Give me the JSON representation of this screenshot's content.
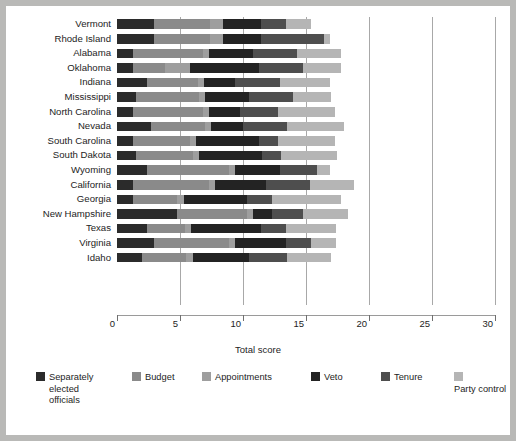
{
  "chart_data": {
    "type": "bar",
    "orientation": "horizontal",
    "stacked": true,
    "title": "",
    "xlabel": "Total score",
    "ylabel": "",
    "xlim": [
      0,
      30
    ],
    "xticks": [
      0,
      5,
      10,
      15,
      20,
      25,
      30
    ],
    "grid": true,
    "legend_position": "bottom",
    "categories": [
      "Vermont",
      "Rhode Island",
      "Alabama",
      "Oklahoma",
      "Indiana",
      "Mississippi",
      "North Carolina",
      "Nevada",
      "South Carolina",
      "South Dakota",
      "Wyoming",
      "California",
      "Georgia",
      "New Hampshire",
      "Texas",
      "Virginia",
      "Idaho"
    ],
    "series": [
      {
        "name": "Separately elected officials",
        "color": "#2b2b2b",
        "values": [
          2.9,
          2.9,
          1.3,
          1.3,
          2.4,
          1.5,
          1.3,
          2.7,
          1.3,
          1.5,
          2.4,
          1.3,
          1.3,
          4.8,
          2.4,
          2.9,
          2.0
        ]
      },
      {
        "name": "Budget",
        "color": "#8a8a8a",
        "values": [
          4.5,
          4.5,
          5.5,
          2.5,
          4.0,
          5.0,
          5.5,
          4.3,
          4.5,
          4.5,
          6.5,
          6.0,
          3.5,
          5.5,
          3.0,
          6.0,
          3.5
        ]
      },
      {
        "name": "Appointments",
        "color": "#9e9e9e",
        "values": [
          1.0,
          1.0,
          0.5,
          2.0,
          0.5,
          0.5,
          0.5,
          0.5,
          0.5,
          0.5,
          0.5,
          0.5,
          0.5,
          0.5,
          0.5,
          0.5,
          0.5
        ]
      },
      {
        "name": "Veto",
        "color": "#232323",
        "values": [
          3.0,
          3.0,
          3.5,
          5.5,
          2.5,
          3.5,
          2.5,
          2.5,
          5.0,
          5.0,
          3.5,
          4.0,
          5.0,
          1.5,
          5.5,
          4.0,
          4.5
        ]
      },
      {
        "name": "Tenure",
        "color": "#4e4e4e",
        "values": [
          2.0,
          5.0,
          3.5,
          3.5,
          3.5,
          3.5,
          3.0,
          3.5,
          1.5,
          1.5,
          3.0,
          3.5,
          2.0,
          2.5,
          2.0,
          2.0,
          3.0
        ]
      },
      {
        "name": "Party control",
        "color": "#b5b5b5",
        "values": [
          2.0,
          0.5,
          3.5,
          3.0,
          4.0,
          3.0,
          4.5,
          4.5,
          4.5,
          4.5,
          1.0,
          3.5,
          5.5,
          3.5,
          4.0,
          2.0,
          3.5
        ]
      }
    ],
    "totals": [
      15.4,
      16.9,
      17.8,
      17.8,
      16.9,
      17.0,
      17.3,
      18.0,
      17.3,
      17.5,
      16.9,
      18.8,
      17.8,
      18.3,
      17.4,
      17.4,
      17.0
    ]
  },
  "axis": {
    "tick_labels": [
      "0",
      "5",
      "10",
      "15",
      "20",
      "25",
      "30"
    ],
    "x_title": "Total score"
  },
  "legend": {
    "items": [
      {
        "label": "Separately elected officials",
        "color": "#2b2b2b"
      },
      {
        "label": "Budget",
        "color": "#8a8a8a"
      },
      {
        "label": "Appointments",
        "color": "#9e9e9e"
      },
      {
        "label": "Veto",
        "color": "#232323"
      },
      {
        "label": "Tenure",
        "color": "#4e4e4e"
      },
      {
        "label": "Party control",
        "color": "#b5b5b5"
      }
    ]
  }
}
